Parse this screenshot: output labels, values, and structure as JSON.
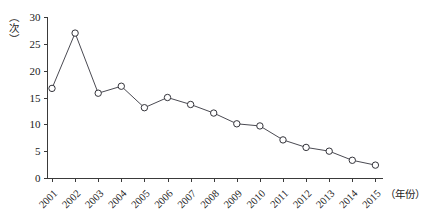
{
  "chart_data": {
    "type": "line",
    "title": "",
    "xlabel": "（年份）",
    "ylabel": "（次）",
    "categories": [
      "2001",
      "2002",
      "2003",
      "2004",
      "2005",
      "2006",
      "2007",
      "2008",
      "2009",
      "2010",
      "2011",
      "2012",
      "2013",
      "2014",
      "2015"
    ],
    "values": [
      16.7,
      27.0,
      15.8,
      17.1,
      13.1,
      15.0,
      13.7,
      12.1,
      10.1,
      9.7,
      7.1,
      5.7,
      5.0,
      3.3,
      2.4
    ],
    "ylim": [
      0,
      30
    ],
    "yticks": [
      0,
      5,
      10,
      15,
      20,
      25,
      30
    ],
    "ytick_labels": [
      "0",
      "5",
      "10",
      "15",
      "20",
      "25",
      "30"
    ],
    "grid": false,
    "legend": "none",
    "marker": "open-circle",
    "line_color": "#4a4a52",
    "marker_fill": "#ffffff",
    "marker_stroke": "#33333a",
    "axis_color": "#3a3a3a",
    "background": "#ffffff"
  }
}
